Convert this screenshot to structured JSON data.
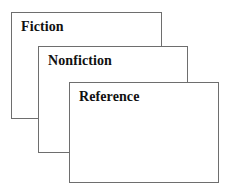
{
  "diagram": {
    "background_color": "#ffffff",
    "card_fill_color": "#ffffff",
    "card_border_color": "#6e6e6e",
    "label_text_color": "#111111",
    "cards": [
      {
        "id": "fiction",
        "label": "Fiction",
        "stack_order": 1
      },
      {
        "id": "nonfiction",
        "label": "Nonfiction",
        "stack_order": 2
      },
      {
        "id": "reference",
        "label": "Reference",
        "stack_order": 3
      }
    ]
  }
}
